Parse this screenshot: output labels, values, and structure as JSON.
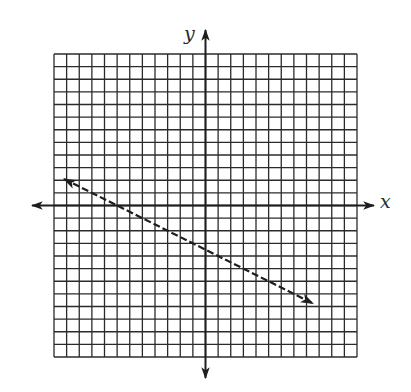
{
  "chart_data": {
    "type": "line",
    "title": "",
    "xlabel": "x",
    "ylabel": "y",
    "xlim": [
      -12,
      12
    ],
    "ylim": [
      -12,
      12
    ],
    "grid": true,
    "grid_step": 1,
    "tick_labels": false,
    "legend": null,
    "series": [
      {
        "name": "line",
        "equation": "y = -0.5x - 3.5",
        "slope": -0.5,
        "y_intercept": -3.5,
        "x_intercept": -7,
        "style": "dashed",
        "arrows": "both",
        "x": [
          -11.2,
          8.5
        ],
        "y": [
          2.1,
          -7.75
        ]
      }
    ]
  },
  "labels": {
    "x_axis": "x",
    "y_axis": "y"
  },
  "colors": {
    "grid": "#2b2b2b",
    "axis": "#1e1e1e",
    "line": "#1e1e1e",
    "background": "#ffffff"
  }
}
